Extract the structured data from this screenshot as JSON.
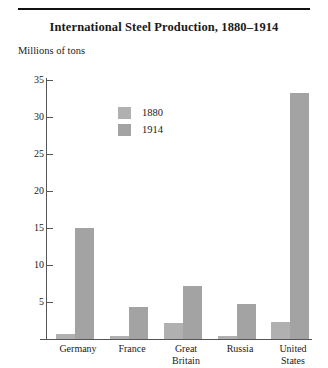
{
  "chart_data": {
    "type": "bar",
    "title": "International Steel Production, 1880–1914",
    "ylabel": "Millions of tons",
    "xlabel": "",
    "ylim": [
      0,
      35
    ],
    "yticks": [
      5,
      10,
      15,
      20,
      25,
      30,
      35
    ],
    "grid": false,
    "legend_position": "upper-left-inside",
    "categories": [
      "Germany",
      "France",
      "Great Britain",
      "Russia",
      "United States"
    ],
    "category_lines": [
      [
        "Germany"
      ],
      [
        "France"
      ],
      [
        "Great",
        "Britain"
      ],
      [
        "Russia"
      ],
      [
        "United",
        "States"
      ]
    ],
    "series": [
      {
        "name": "1880",
        "color": "#b0b0b0",
        "values": [
          0.7,
          0.4,
          2.1,
          0.4,
          2.3
        ]
      },
      {
        "name": "1914",
        "color": "#a3a3a3",
        "values": [
          15.0,
          4.3,
          7.1,
          4.7,
          33.2
        ]
      }
    ]
  },
  "colors": {
    "series_1880": "#b0b0b0",
    "series_1914": "#a3a3a3",
    "axis": "#555555",
    "rule": "#111111",
    "text": "#1a1a1a",
    "background": "#ffffff"
  }
}
